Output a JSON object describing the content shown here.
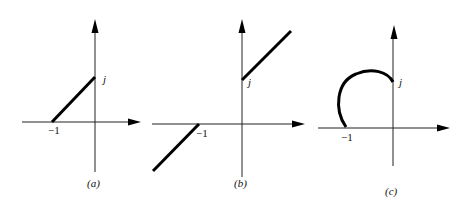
{
  "figure": {
    "panels": [
      {
        "id": "a",
        "caption": "(a)",
        "real_label": "−1",
        "imag_label": "j",
        "description": "Straight line segment from -1 to j"
      },
      {
        "id": "b",
        "caption": "(b)",
        "real_label": "−1",
        "imag_label": "j",
        "description": "Two rays: one extending from -1 down-left, one from j up-right"
      },
      {
        "id": "c",
        "caption": "(c)",
        "real_label": "−1",
        "imag_label": "j",
        "description": "Circular arc from -1 curving up and over to j"
      }
    ],
    "colors": {
      "curve": "#000000",
      "axis": "#222222",
      "background": "#ffffff"
    }
  }
}
